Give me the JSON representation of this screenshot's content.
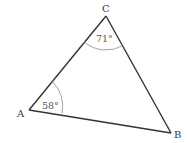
{
  "diagram": {
    "type": "triangle",
    "vertices": {
      "A": {
        "label": "A",
        "x": 29,
        "y": 110
      },
      "B": {
        "label": "B",
        "x": 171,
        "y": 133
      },
      "C": {
        "label": "C",
        "x": 106,
        "y": 16
      }
    },
    "angles": {
      "A": {
        "label": "58°"
      },
      "C": {
        "label": "71°"
      }
    },
    "colors": {
      "line": "#333333",
      "arc": "#999999",
      "text": "#333333"
    }
  }
}
